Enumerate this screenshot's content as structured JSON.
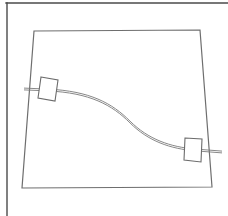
{
  "figure": {
    "title": "",
    "background_color": "#ffffff",
    "width": 228,
    "height": 216
  },
  "frame": {
    "name": "page-border",
    "stroke_color": "#4a4a4a",
    "stroke_width": 1.4,
    "top_edge": {
      "x1": 6,
      "y1": 3,
      "x2": 228,
      "y2": 3
    },
    "left_edge": {
      "x1": 7,
      "y1": 3,
      "x2": 7,
      "y2": 216
    }
  },
  "panel": {
    "name": "perspective-panel",
    "description": "quadrilateral outline of a flat panel in perspective",
    "stroke_color": "#6e6e6e",
    "stroke_width": 1.2,
    "fill_color": "#ffffff",
    "corners": [
      {
        "label": "top-left",
        "x": 34,
        "y": 31
      },
      {
        "label": "top-right",
        "x": 200,
        "y": 30
      },
      {
        "label": "bottom-right",
        "x": 212,
        "y": 187
      },
      {
        "label": "bottom-left",
        "x": 22,
        "y": 188
      }
    ]
  },
  "cable": {
    "name": "s-curve-cable",
    "description": "double-line S-shaped cable running between the two connector blocks",
    "stroke_color": "#7a7a7a",
    "stroke_width": 0.9,
    "edge_offset": 1.8,
    "center_path": "M 48 90 C 90 92 112 104 130 122 C 148 140 170 148 196 150",
    "left_stub": {
      "x1": 24,
      "y1": 89,
      "x2": 48,
      "y2": 90
    },
    "right_stub": {
      "x1": 196,
      "y1": 150,
      "x2": 222,
      "y2": 152
    }
  },
  "blocks": [
    {
      "name": "left-connector-block",
      "stroke_color": "#6b6b6b",
      "stroke_width": 1.1,
      "fill_color": "#ffffff",
      "points": "41,77 58,80 55,101 38,98"
    },
    {
      "name": "right-connector-block",
      "stroke_color": "#6b6b6b",
      "stroke_width": 1.1,
      "fill_color": "#ffffff",
      "points": "185,138 202,139 201,162 184,160"
    }
  ],
  "chart_data": {
    "type": "line",
    "title": "",
    "xlabel": "",
    "ylabel": "",
    "series": [
      {
        "name": "cable-centerline",
        "x": [
          48,
          70,
          90,
          110,
          130,
          150,
          170,
          196
        ],
        "y": [
          90,
          92,
          96,
          107,
          122,
          136,
          145,
          150
        ]
      }
    ],
    "annotations": [
      {
        "label": "left-connector-block",
        "x": 48,
        "y": 89
      },
      {
        "label": "right-connector-block",
        "x": 193,
        "y": 150
      }
    ],
    "grid": false,
    "legend": "none",
    "xlim": [
      22,
      228
    ],
    "ylim": [
      0,
      216
    ]
  }
}
